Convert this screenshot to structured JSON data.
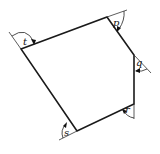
{
  "figure": {
    "type": "pentagon with exterior angles",
    "angle_labels": [
      "t",
      "p",
      "q",
      "r",
      "s"
    ],
    "colors": {
      "line": "#1a1a1a",
      "background": "#ffffff"
    }
  }
}
